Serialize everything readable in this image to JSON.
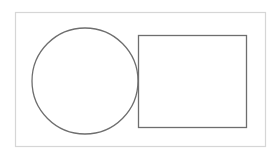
{
  "canvas": {
    "width": 278,
    "height": 154,
    "background": "#ffffff"
  },
  "frame": {
    "x": 15.5,
    "y": 12.5,
    "width": 250,
    "height": 134,
    "stroke": "#d6d6d6",
    "stroke_width": 1.2
  },
  "shapes": {
    "circle": {
      "cx": 85,
      "cy": 81,
      "r": 53,
      "stroke": "#6e6e6e",
      "stroke_width": 1.3,
      "fill": "none"
    },
    "rectangle": {
      "x": 138.5,
      "y": 35.5,
      "width": 108,
      "height": 92,
      "stroke": "#6e6e6e",
      "stroke_width": 1.3,
      "fill": "none"
    }
  }
}
